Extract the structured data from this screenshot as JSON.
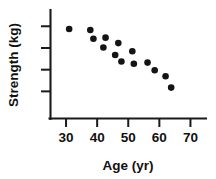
{
  "chart_data": {
    "type": "scatter",
    "title": "",
    "xlabel": "Age (yr)",
    "ylabel": "Strength  (kg)",
    "xlim": [
      25,
      75
    ],
    "ylim": [
      0,
      10
    ],
    "grid": false,
    "legend": "none",
    "x_ticks": [
      {
        "value": 30,
        "label": "30"
      },
      {
        "value": 40,
        "label": "40"
      },
      {
        "value": 50,
        "label": "50"
      },
      {
        "value": 60,
        "label": "60"
      },
      {
        "value": 70,
        "label": "70"
      }
    ],
    "y_ticks": [
      {
        "value": 8.5,
        "label": ""
      },
      {
        "value": 6.5,
        "label": ""
      },
      {
        "value": 4.5,
        "label": ""
      },
      {
        "value": 2.5,
        "label": ""
      }
    ],
    "series": [
      {
        "name": "strength-vs-age",
        "marker": "filled-circle",
        "color": "#141414",
        "points": [
          {
            "x": 31.0,
            "y": 8.25
          },
          {
            "x": 37.8,
            "y": 8.15
          },
          {
            "x": 38.8,
            "y": 7.35
          },
          {
            "x": 42.7,
            "y": 7.45
          },
          {
            "x": 42.0,
            "y": 6.55
          },
          {
            "x": 46.8,
            "y": 6.95
          },
          {
            "x": 45.8,
            "y": 5.85
          },
          {
            "x": 51.3,
            "y": 6.2
          },
          {
            "x": 47.8,
            "y": 5.25
          },
          {
            "x": 51.8,
            "y": 5.05
          },
          {
            "x": 56.2,
            "y": 5.15
          },
          {
            "x": 58.5,
            "y": 4.45
          },
          {
            "x": 62.0,
            "y": 3.9
          },
          {
            "x": 63.8,
            "y": 2.85
          }
        ]
      }
    ]
  },
  "labels": {
    "x_axis_title": "Age (yr)",
    "y_axis_title": "Strength  (kg)"
  }
}
